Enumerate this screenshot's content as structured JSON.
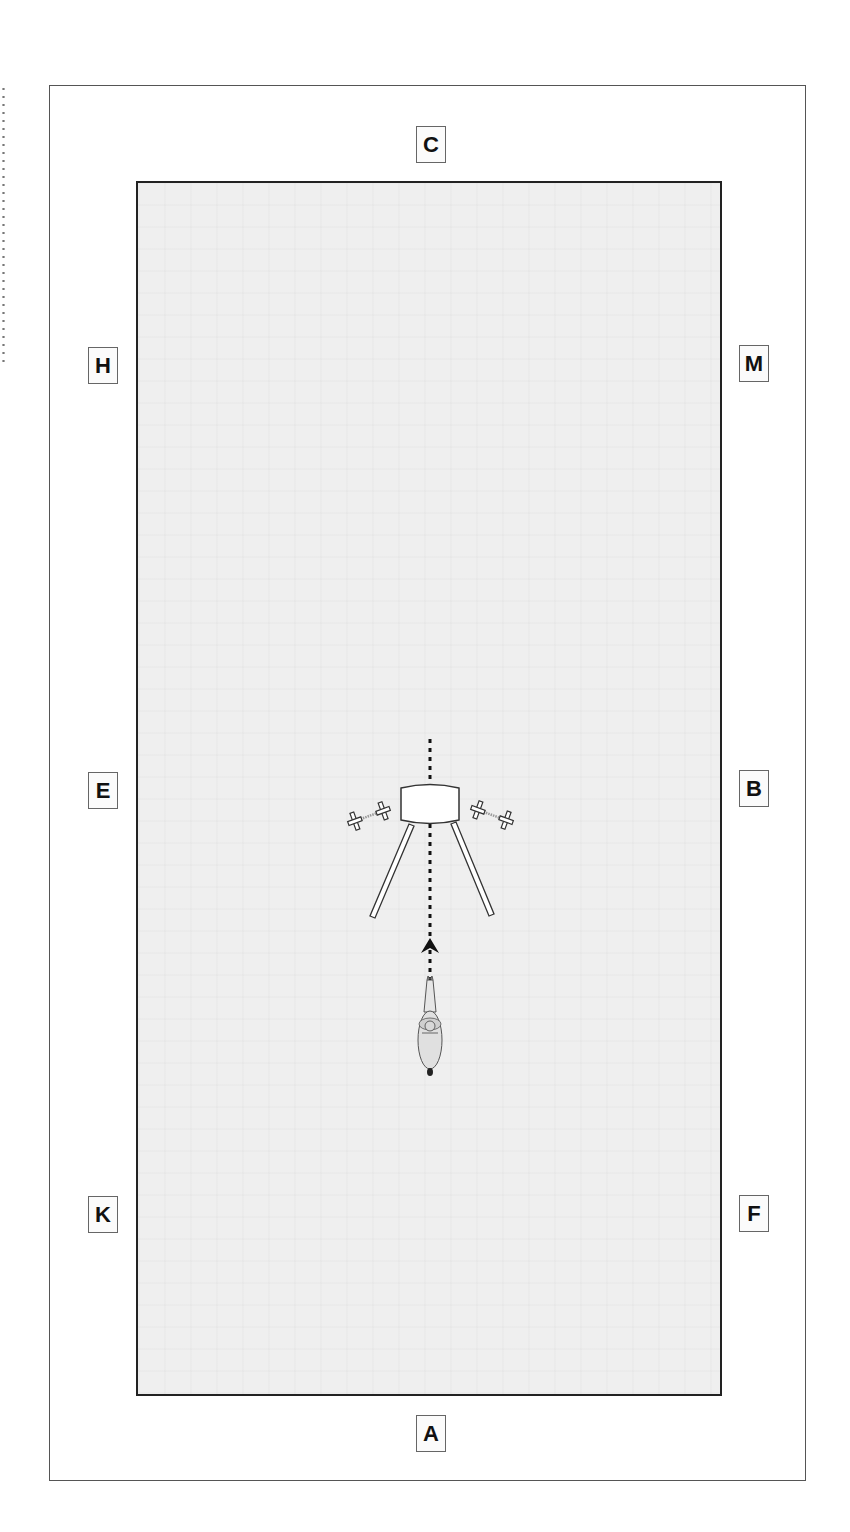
{
  "diagram": {
    "markers": {
      "C": "C",
      "H": "H",
      "M": "M",
      "E": "E",
      "B": "B",
      "K": "K",
      "F": "F",
      "A": "A"
    },
    "elements": {
      "obstacle": "barrel-with-poles",
      "dumbbells": [
        "left",
        "right"
      ],
      "path": "dotted-center-line",
      "direction": "up",
      "rider": "horse-and-rider-top-view"
    },
    "colors": {
      "arena_fill": "#efefef",
      "arena_border": "#222222",
      "outer_border": "#555555",
      "marker_border": "#666666",
      "marker_text": "#111111"
    }
  }
}
